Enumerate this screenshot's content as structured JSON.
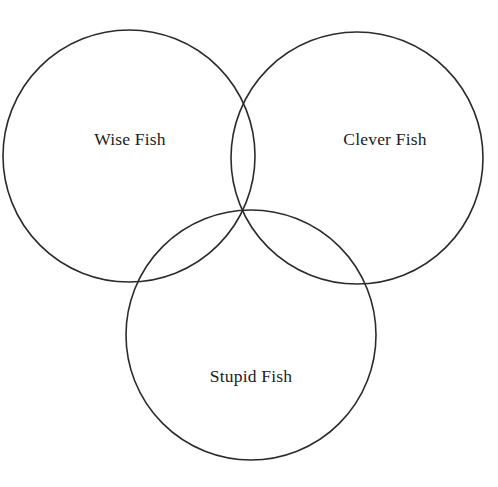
{
  "diagram": {
    "type": "venn",
    "title": "",
    "background_color": "#ffffff",
    "stroke_color": "#2b2b2b",
    "label_color": "#1c1c1c",
    "sets": [
      {
        "id": "wise",
        "label": "Wise Fish",
        "cx": 129,
        "cy": 156,
        "r": 126,
        "label_x": 130,
        "label_y": 145
      },
      {
        "id": "clever",
        "label": "Clever Fish",
        "cx": 357,
        "cy": 158,
        "r": 126,
        "label_x": 385,
        "label_y": 145
      },
      {
        "id": "stupid",
        "label": "Stupid Fish",
        "cx": 251,
        "cy": 335,
        "r": 125,
        "label_x": 251,
        "label_y": 382
      }
    ]
  }
}
